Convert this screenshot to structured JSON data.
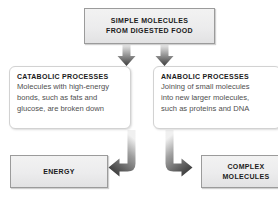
{
  "diagram": {
    "colors": {
      "box_fill_top": "#f2f2f2",
      "box_fill_bottom": "#e2e2e3",
      "box_border": "#9b9b9b",
      "panel_border": "#d2d2d2",
      "panel_background": "#ffffff",
      "arrow_dark": "#3a3a3a",
      "arrow_light": "#d8d8d8",
      "heading_text": "#1b1b1b",
      "body_text": "#4f4f4f",
      "page_background": "#ffffff"
    },
    "top_box": {
      "line1": "SIMPLE MOLECULES",
      "line2": "FROM DIGESTED FOOD"
    },
    "panels": [
      {
        "id": "catabolic",
        "title": "CATABOLIC PROCESSES",
        "lines": [
          "Molecules with high-energy",
          "bonds, such as fats and",
          "glucose, are broken down"
        ]
      },
      {
        "id": "anabolic",
        "title": "ANABOLIC PROCESSES",
        "lines": [
          "Joining of small molecules",
          "into new larger molecules,",
          "such as proteins and DNA"
        ]
      }
    ],
    "outputs": [
      {
        "id": "energy",
        "line1": "ENERGY",
        "line2": ""
      },
      {
        "id": "complex",
        "line1": "COMPLEX",
        "line2": "MOLECULES"
      }
    ],
    "arrows": [
      {
        "id": "top-to-catabolic",
        "shape": "down-arrow",
        "direction": "down"
      },
      {
        "id": "top-to-anabolic",
        "shape": "down-arrow",
        "direction": "down"
      },
      {
        "id": "catabolic-to-energy",
        "shape": "elbow-arrow",
        "direction": "down-then-left"
      },
      {
        "id": "anabolic-to-complex",
        "shape": "elbow-arrow",
        "direction": "down-then-right"
      }
    ]
  }
}
